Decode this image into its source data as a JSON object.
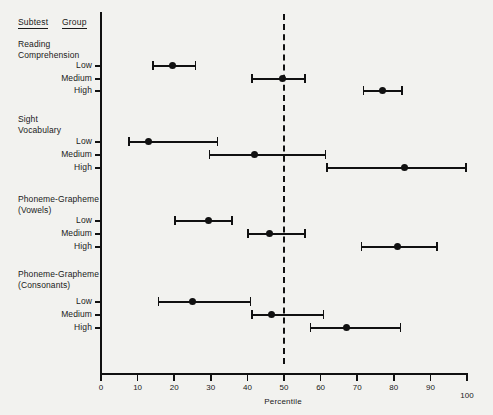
{
  "headers": {
    "subtest": "Subtest",
    "group": "Group"
  },
  "xaxis_title": "Percentile",
  "chart_data": {
    "type": "scatter",
    "title": "",
    "xlabel": "Percentile",
    "ylabel": "",
    "xlim": [
      0,
      100
    ],
    "xticks": [
      0,
      10,
      20,
      30,
      40,
      50,
      60,
      70,
      80,
      90,
      100
    ],
    "grid": false,
    "legend": null,
    "reference_line": {
      "value": 50,
      "style": "dashed",
      "orientation": "vertical"
    },
    "marker": "point-with-range",
    "groups": [
      {
        "subtest": "Reading\nComprehension",
        "rows": [
          {
            "group": "Low",
            "value": 19.5,
            "low": 14,
            "high": 26
          },
          {
            "group": "Medium",
            "value": 49.5,
            "low": 41,
            "high": 56
          },
          {
            "group": "High",
            "value": 77,
            "low": 71.5,
            "high": 82.5
          }
        ]
      },
      {
        "subtest": "Sight\nVocabulary",
        "rows": [
          {
            "group": "Low",
            "value": 13,
            "low": 7.5,
            "high": 32
          },
          {
            "group": "Medium",
            "value": 42,
            "low": 29.5,
            "high": 61.5
          },
          {
            "group": "High",
            "value": 83,
            "low": 61.5,
            "high": 100
          }
        ]
      },
      {
        "subtest": "Phoneme-Grapheme\n(Vowels)",
        "rows": [
          {
            "group": "Low",
            "value": 29.5,
            "low": 20,
            "high": 36
          },
          {
            "group": "Medium",
            "value": 46,
            "low": 40,
            "high": 56
          },
          {
            "group": "High",
            "value": 81,
            "low": 71,
            "high": 92
          }
        ]
      },
      {
        "subtest": "Phoneme-Grapheme\n(Consonants)",
        "rows": [
          {
            "group": "Low",
            "value": 25,
            "low": 15.5,
            "high": 41
          },
          {
            "group": "Medium",
            "value": 46.5,
            "low": 41,
            "high": 61
          },
          {
            "group": "High",
            "value": 67,
            "low": 57,
            "high": 82
          }
        ]
      }
    ]
  },
  "colors": {
    "background": "#f2f2ef",
    "ink": "#111111"
  }
}
